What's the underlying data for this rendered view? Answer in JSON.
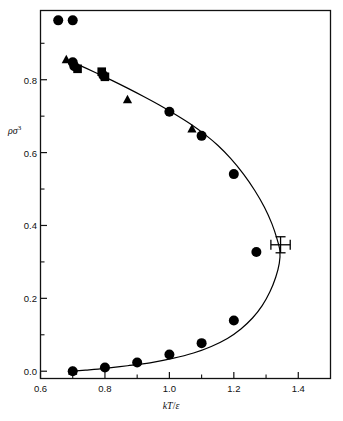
{
  "chart_data": {
    "type": "scatter",
    "title": "",
    "subtitle": "",
    "xlabel": "kT/ε",
    "ylabel": "ρσ³",
    "xlabel_parts": {
      "italic1": "kT",
      "slash": "/",
      "italic2": "ε"
    },
    "ylabel_parts": {
      "base": "ρσ",
      "exponent": "3"
    },
    "xlim": [
      0.6,
      1.5
    ],
    "ylim": [
      -0.02,
      0.99
    ],
    "xticks": [
      0.6,
      0.8,
      1.0,
      1.2,
      1.4
    ],
    "xtick_labels": [
      "0.6",
      "0.8",
      "1.0",
      "1.2",
      "1.4"
    ],
    "yticks": [
      0.0,
      0.2,
      0.4,
      0.6,
      0.8
    ],
    "ytick_labels": [
      "0.0",
      "0.2",
      "0.4",
      "0.6",
      "0.8"
    ],
    "x_minor_ticks": [
      0.7,
      0.9,
      1.1,
      1.3,
      1.5
    ],
    "y_minor_ticks": [
      0.1,
      0.3,
      0.5,
      0.7,
      0.9
    ],
    "grid": false,
    "legend": "none",
    "frame": true,
    "series": [
      {
        "name": "circles",
        "marker": "circle",
        "color": "#000000",
        "points": [
          {
            "x": 0.655,
            "y": 0.963
          },
          {
            "x": 0.7,
            "y": 0.963
          },
          {
            "x": 0.7,
            "y": 0.848
          },
          {
            "x": 0.705,
            "y": 0.837
          },
          {
            "x": 0.795,
            "y": 0.812
          },
          {
            "x": 1.0,
            "y": 0.712
          },
          {
            "x": 1.1,
            "y": 0.646
          },
          {
            "x": 1.2,
            "y": 0.541
          },
          {
            "x": 1.27,
            "y": 0.327
          },
          {
            "x": 1.2,
            "y": 0.139
          },
          {
            "x": 1.1,
            "y": 0.077
          },
          {
            "x": 1.0,
            "y": 0.046
          },
          {
            "x": 0.9,
            "y": 0.024
          },
          {
            "x": 0.8,
            "y": 0.01
          },
          {
            "x": 0.7,
            "y": 0.0
          }
        ]
      },
      {
        "name": "triangles",
        "marker": "triangle",
        "color": "#000000",
        "points": [
          {
            "x": 0.68,
            "y": 0.855
          },
          {
            "x": 0.87,
            "y": 0.745
          },
          {
            "x": 1.07,
            "y": 0.665
          },
          {
            "x": 0.7,
            "y": 0.0
          }
        ]
      },
      {
        "name": "squares",
        "marker": "square",
        "color": "#000000",
        "points": [
          {
            "x": 0.715,
            "y": 0.83
          },
          {
            "x": 0.79,
            "y": 0.822
          },
          {
            "x": 0.8,
            "y": 0.808
          }
        ]
      },
      {
        "name": "critical-point",
        "marker": "errorbar-cross",
        "color": "#000000",
        "points": [
          {
            "x": 1.345,
            "y": 0.347,
            "xerr": 0.03,
            "yerr": 0.022
          }
        ]
      }
    ],
    "curve": {
      "name": "coexistence-curve",
      "color": "#000000",
      "width": 1.2,
      "points": [
        {
          "x": 0.678,
          "y": 0.856
        },
        {
          "x": 0.72,
          "y": 0.84
        },
        {
          "x": 0.77,
          "y": 0.82
        },
        {
          "x": 0.82,
          "y": 0.799
        },
        {
          "x": 0.87,
          "y": 0.777
        },
        {
          "x": 0.92,
          "y": 0.754
        },
        {
          "x": 0.97,
          "y": 0.73
        },
        {
          "x": 1.02,
          "y": 0.704
        },
        {
          "x": 1.07,
          "y": 0.676
        },
        {
          "x": 1.11,
          "y": 0.65
        },
        {
          "x": 1.15,
          "y": 0.62
        },
        {
          "x": 1.19,
          "y": 0.584
        },
        {
          "x": 1.23,
          "y": 0.541
        },
        {
          "x": 1.265,
          "y": 0.496
        },
        {
          "x": 1.295,
          "y": 0.45
        },
        {
          "x": 1.318,
          "y": 0.405
        },
        {
          "x": 1.334,
          "y": 0.363
        },
        {
          "x": 1.343,
          "y": 0.33
        },
        {
          "x": 1.341,
          "y": 0.296
        },
        {
          "x": 1.33,
          "y": 0.258
        },
        {
          "x": 1.312,
          "y": 0.218
        },
        {
          "x": 1.288,
          "y": 0.18
        },
        {
          "x": 1.258,
          "y": 0.146
        },
        {
          "x": 1.222,
          "y": 0.116
        },
        {
          "x": 1.18,
          "y": 0.09
        },
        {
          "x": 1.13,
          "y": 0.068
        },
        {
          "x": 1.075,
          "y": 0.05
        },
        {
          "x": 1.01,
          "y": 0.035
        },
        {
          "x": 0.94,
          "y": 0.023
        },
        {
          "x": 0.87,
          "y": 0.015
        },
        {
          "x": 0.8,
          "y": 0.008
        },
        {
          "x": 0.74,
          "y": 0.003
        },
        {
          "x": 0.7,
          "y": 0.0
        }
      ]
    }
  }
}
